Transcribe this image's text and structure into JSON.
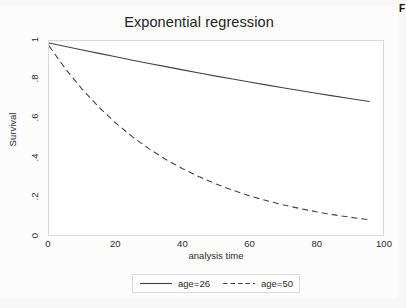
{
  "corner": {
    "text": "F"
  },
  "chart_data": {
    "type": "line",
    "title": "Exponential regression",
    "xlabel": "analysis time",
    "ylabel": "Survival",
    "xlim": [
      0,
      100
    ],
    "ylim": [
      0,
      1
    ],
    "xticks": [
      0,
      20,
      40,
      60,
      80,
      100
    ],
    "xtick_labels": [
      "0",
      "20",
      "40",
      "60",
      "80",
      "100"
    ],
    "yticks": [
      0,
      0.2,
      0.4,
      0.6,
      0.8,
      1
    ],
    "ytick_labels": [
      "0",
      ".2",
      ".4",
      ".6",
      ".8",
      "1"
    ],
    "grid": false,
    "legend_position": "bottom",
    "series": [
      {
        "name": "age=26",
        "style": "solid",
        "color": "#404040",
        "x": [
          0,
          5,
          10,
          15,
          20,
          25,
          30,
          35,
          40,
          45,
          50,
          55,
          60,
          65,
          70,
          75,
          80,
          85,
          90,
          96
        ],
        "y": [
          0.99,
          0.972,
          0.954,
          0.936,
          0.919,
          0.901,
          0.884,
          0.868,
          0.851,
          0.835,
          0.819,
          0.804,
          0.789,
          0.774,
          0.759,
          0.745,
          0.731,
          0.717,
          0.704,
          0.688
        ]
      },
      {
        "name": "age=50",
        "style": "dashed",
        "color": "#404040",
        "x": [
          0,
          5,
          10,
          15,
          20,
          25,
          30,
          35,
          40,
          45,
          50,
          55,
          60,
          65,
          70,
          75,
          80,
          85,
          90,
          96
        ],
        "y": [
          0.975,
          0.855,
          0.75,
          0.658,
          0.577,
          0.506,
          0.444,
          0.389,
          0.342,
          0.3,
          0.263,
          0.231,
          0.202,
          0.178,
          0.156,
          0.137,
          0.12,
          0.105,
          0.092,
          0.078
        ]
      }
    ]
  },
  "legend": {
    "entries": [
      {
        "label": "age=26",
        "style": "solid"
      },
      {
        "label": "age=50",
        "style": "dashed"
      }
    ]
  }
}
